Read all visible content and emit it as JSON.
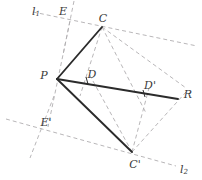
{
  "figure": {
    "type": "geometry-diagram",
    "width": 202,
    "height": 180,
    "background_color": "#ffffff",
    "solid_stroke_color": "#2b2b2b",
    "dashed_stroke_color": "#b0aeb0",
    "label_color": "#3a3a3a"
  },
  "labels": {
    "l1": "l",
    "l1_sub": "1",
    "l2": "l",
    "l2_sub": "2",
    "E": "E",
    "E_prime": "E'",
    "C": "C",
    "C_prime": "C'",
    "D": "D",
    "D_prime": "D'",
    "P": "P",
    "R": "R"
  },
  "points": {
    "P": {
      "x": 57,
      "y": 79,
      "label": "P",
      "label_x": 44,
      "label_y": 74
    },
    "C": {
      "x": 102,
      "y": 27,
      "label": "C",
      "label_x": 103,
      "label_y": 17
    },
    "C_prime": {
      "x": 132,
      "y": 152,
      "label": "C'",
      "label_x": 134,
      "label_y": 163
    },
    "D": {
      "x": 87,
      "y": 80,
      "label": "D",
      "label_x": 92,
      "label_y": 73
    },
    "D_prime": {
      "x": 144,
      "y": 93,
      "label": "D'",
      "label_x": 149,
      "label_y": 84
    },
    "E": {
      "x": 70,
      "y": 21,
      "label": "E",
      "label_x": 63,
      "label_y": 10
    },
    "E_prime": {
      "x": 48,
      "y": 127,
      "label": "E'",
      "label_x": 45,
      "label_y": 122
    },
    "R": {
      "x": 178,
      "y": 99,
      "label": "R",
      "label_x": 187,
      "label_y": 93
    }
  },
  "solid_segments": [
    {
      "name": "segment-PC",
      "x1": 57,
      "y1": 79,
      "x2": 102,
      "y2": 27
    },
    {
      "name": "segment-PR",
      "x1": 57,
      "y1": 79,
      "x2": 178,
      "y2": 99
    },
    {
      "name": "segment-PCprime",
      "x1": 57,
      "y1": 79,
      "x2": 132,
      "y2": 152
    }
  ],
  "dashed_lines": [
    {
      "name": "line-l1",
      "x1": 33,
      "y1": 12,
      "x2": 197,
      "y2": 46
    },
    {
      "name": "line-l2",
      "x1": 6,
      "y1": 119,
      "x2": 176,
      "y2": 166
    },
    {
      "name": "line-through-E",
      "x1": 74,
      "y1": 1,
      "x2": 63,
      "y2": 55
    },
    {
      "name": "line-through-Eprime",
      "x1": 54,
      "y1": 96,
      "x2": 30,
      "y2": 158
    },
    {
      "name": "line-PE-axis",
      "x1": 70,
      "y1": 21,
      "x2": 48,
      "y2": 127
    },
    {
      "name": "chord-CD",
      "x1": 102,
      "y1": 27,
      "x2": 80,
      "y2": 96
    },
    {
      "name": "chord-C-Dprime",
      "x1": 102,
      "y1": 27,
      "x2": 146,
      "y2": 113
    },
    {
      "name": "chord-C-R",
      "x1": 102,
      "y1": 27,
      "x2": 186,
      "y2": 88
    },
    {
      "name": "chord-Cprime-Dprime",
      "x1": 132,
      "y1": 152,
      "x2": 149,
      "y2": 88
    },
    {
      "name": "chord-Cprime-R",
      "x1": 132,
      "y1": 152,
      "x2": 186,
      "y2": 92
    },
    {
      "name": "chord-Cprime-D",
      "x1": 132,
      "y1": 152,
      "x2": 88,
      "y2": 72
    }
  ],
  "tick_marks": [
    {
      "name": "tick-D",
      "x": 87,
      "y": 80
    },
    {
      "name": "tick-Dprime",
      "x": 144,
      "y": 93
    }
  ]
}
